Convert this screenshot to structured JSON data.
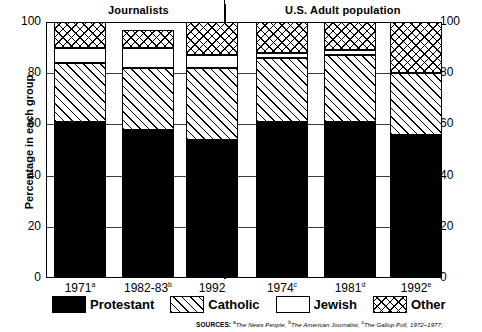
{
  "chart_data": {
    "type": "bar",
    "subtype": "stacked-100",
    "title": "",
    "xlabel": "",
    "ylabel": "Percentage in each group",
    "ylim": [
      0,
      100
    ],
    "yticks": [
      0,
      20,
      40,
      60,
      80,
      100
    ],
    "ytick_labels_left": [
      "100",
      "80",
      "60",
      "40",
      "20",
      "0"
    ],
    "ytick_labels_right": [
      "100",
      "80",
      "60",
      "40",
      "20",
      "0"
    ],
    "grid": true,
    "legend_position": "bottom",
    "groups": [
      {
        "name": "Journalists",
        "categories": [
          "1971",
          "1982-83",
          "1992"
        ]
      },
      {
        "name": "U.S. Adult population",
        "categories": [
          "1974",
          "1981",
          "1992"
        ]
      }
    ],
    "categories": [
      "1971",
      "1982-83",
      "1992",
      "1974",
      "1981",
      "1992"
    ],
    "category_footnotes": [
      "a",
      "b",
      "",
      "c",
      "d",
      "e"
    ],
    "series": [
      {
        "name": "Protestant",
        "pattern": "solid-black",
        "values": [
          61,
          58,
          54,
          61,
          61,
          56
        ]
      },
      {
        "name": "Catholic",
        "pattern": "diagonal-hatch",
        "values": [
          23,
          24,
          28,
          25,
          26,
          24
        ]
      },
      {
        "name": "Jewish",
        "pattern": "white",
        "values": [
          6,
          8,
          5,
          2,
          2,
          0
        ]
      },
      {
        "name": "Other",
        "pattern": "cross-hatch",
        "values": [
          10,
          7,
          13,
          12,
          11,
          20
        ]
      }
    ]
  },
  "header": {
    "group_left": "Journalists",
    "group_right": "U.S. Adult population"
  },
  "axis": {
    "ylabel": "Percentage in each group",
    "yticks": [
      "100",
      "80",
      "60",
      "40",
      "20",
      "0"
    ],
    "xticks": [
      {
        "label": "1971",
        "note": "a"
      },
      {
        "label": "1982-83",
        "note": "b"
      },
      {
        "label": "1992",
        "note": ""
      },
      {
        "label": "1974",
        "note": "c"
      },
      {
        "label": "1981",
        "note": "d"
      },
      {
        "label": "1992",
        "note": "e"
      }
    ]
  },
  "legend": {
    "items": [
      {
        "label": "Protestant",
        "swatch": "solid-black-swatch"
      },
      {
        "label": "Catholic",
        "swatch": "diagonal-hatch-swatch"
      },
      {
        "label": "Jewish",
        "swatch": "white-swatch"
      },
      {
        "label": "Other",
        "swatch": "cross-hatch-swatch"
      }
    ]
  },
  "sources": {
    "label": "SOURCES:",
    "entries": [
      {
        "note": "a",
        "text": "The News People,"
      },
      {
        "note": "b",
        "text": "The American Journalist,"
      },
      {
        "note": "c",
        "text": "The Gallup Poll, 1972–1977;"
      }
    ]
  },
  "colors": {
    "ink": "#000000",
    "background": "#ffffff",
    "gridline": "#3a3a3a"
  }
}
